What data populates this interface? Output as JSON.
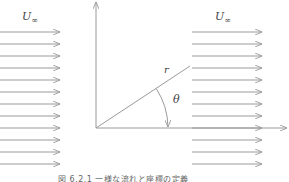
{
  "figure": {
    "left_flow_label": {
      "symbol": "U",
      "subscript": "∞"
    },
    "right_flow_label": {
      "symbol": "U",
      "subscript": "∞"
    },
    "radius_label": "r",
    "angle_label": "θ",
    "caption": "図 6.2.1  一様な流れと座標の定義",
    "arrow_rows_y": [
      32,
      44,
      56,
      68,
      80,
      92,
      104,
      116,
      128,
      140,
      152,
      164
    ],
    "left_arrows": {
      "x_start": 0,
      "x_end": 60
    },
    "right_arrows": {
      "x_start": 192,
      "x_end": 262
    },
    "origin": {
      "x": 96,
      "y": 128
    },
    "axes": {
      "vertical_top_y": 2,
      "horizontal_end_x": 287
    },
    "radius_line_end": {
      "x": 190,
      "y": 66
    },
    "colors": {
      "stroke": "#9a9a9a",
      "text": "#444444"
    }
  }
}
